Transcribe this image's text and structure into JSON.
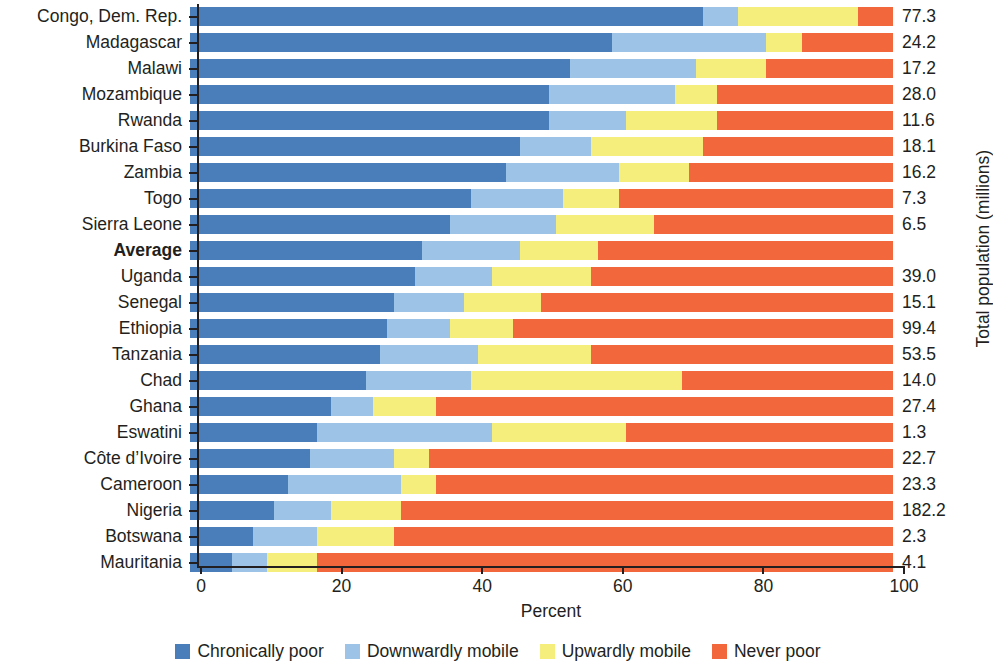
{
  "chart_data": {
    "type": "bar",
    "orientation": "horizontal",
    "stacked": true,
    "stacked_unit": "percent",
    "title": "",
    "xlabel": "Percent",
    "ylabel": "",
    "right_axis_label": "Total population (millions)",
    "xlim": [
      0,
      100
    ],
    "xticks": [
      0,
      20,
      40,
      60,
      80,
      100
    ],
    "xtick_labels": [
      "0",
      "20",
      "40",
      "60",
      "80",
      "100"
    ],
    "grid": false,
    "legend_position": "bottom",
    "series": [
      {
        "name": "Chronically poor",
        "color": "#4a7ebb",
        "key": "chronically_poor"
      },
      {
        "name": "Downwardly mobile",
        "color": "#9dc3e6",
        "key": "downwardly_mobile"
      },
      {
        "name": "Upwardly mobile",
        "color": "#f5ee7d",
        "key": "upwardly_mobile"
      },
      {
        "name": "Never poor",
        "color": "#f2683c",
        "key": "never_poor"
      }
    ],
    "categories": [
      "Congo, Dem. Rep.",
      "Madagascar",
      "Malawi",
      "Mozambique",
      "Rwanda",
      "Burkina Faso",
      "Zambia",
      "Togo",
      "Sierra Leone",
      "Average",
      "Uganda",
      "Senegal",
      "Ethiopia",
      "Tanzania",
      "Chad",
      "Ghana",
      "Eswatini",
      "Côte d’Ivoire",
      "Cameroon",
      "Nigeria",
      "Botswana",
      "Mauritania"
    ],
    "rows": [
      {
        "category": "Congo, Dem. Rep.",
        "chronically_poor": 73.0,
        "downwardly_mobile": 5.0,
        "upwardly_mobile": 17.0,
        "never_poor": 5.0,
        "total_population": "77.3",
        "bold": false
      },
      {
        "category": "Madagascar",
        "chronically_poor": 60.0,
        "downwardly_mobile": 22.0,
        "upwardly_mobile": 5.0,
        "never_poor": 13.0,
        "total_population": "24.2",
        "bold": false
      },
      {
        "category": "Malawi",
        "chronically_poor": 54.0,
        "downwardly_mobile": 18.0,
        "upwardly_mobile": 10.0,
        "never_poor": 18.0,
        "total_population": "17.2",
        "bold": false
      },
      {
        "category": "Mozambique",
        "chronically_poor": 51.0,
        "downwardly_mobile": 18.0,
        "upwardly_mobile": 6.0,
        "never_poor": 25.0,
        "total_population": "28.0",
        "bold": false
      },
      {
        "category": "Rwanda",
        "chronically_poor": 51.0,
        "downwardly_mobile": 11.0,
        "upwardly_mobile": 13.0,
        "never_poor": 25.0,
        "total_population": "11.6",
        "bold": false
      },
      {
        "category": "Burkina Faso",
        "chronically_poor": 47.0,
        "downwardly_mobile": 10.0,
        "upwardly_mobile": 16.0,
        "never_poor": 27.0,
        "total_population": "18.1",
        "bold": false
      },
      {
        "category": "Zambia",
        "chronically_poor": 45.0,
        "downwardly_mobile": 16.0,
        "upwardly_mobile": 10.0,
        "never_poor": 29.0,
        "total_population": "16.2",
        "bold": false
      },
      {
        "category": "Togo",
        "chronically_poor": 40.0,
        "downwardly_mobile": 13.0,
        "upwardly_mobile": 8.0,
        "never_poor": 39.0,
        "total_population": "7.3",
        "bold": false
      },
      {
        "category": "Sierra Leone",
        "chronically_poor": 37.0,
        "downwardly_mobile": 15.0,
        "upwardly_mobile": 14.0,
        "never_poor": 34.0,
        "total_population": "6.5",
        "bold": false
      },
      {
        "category": "Average",
        "chronically_poor": 33.0,
        "downwardly_mobile": 14.0,
        "upwardly_mobile": 11.0,
        "never_poor": 42.0,
        "total_population": "",
        "bold": true
      },
      {
        "category": "Uganda",
        "chronically_poor": 32.0,
        "downwardly_mobile": 11.0,
        "upwardly_mobile": 14.0,
        "never_poor": 43.0,
        "total_population": "39.0",
        "bold": false
      },
      {
        "category": "Senegal",
        "chronically_poor": 29.0,
        "downwardly_mobile": 10.0,
        "upwardly_mobile": 11.0,
        "never_poor": 50.0,
        "total_population": "15.1",
        "bold": false
      },
      {
        "category": "Ethiopia",
        "chronically_poor": 28.0,
        "downwardly_mobile": 9.0,
        "upwardly_mobile": 9.0,
        "never_poor": 54.0,
        "total_population": "99.4",
        "bold": false
      },
      {
        "category": "Tanzania",
        "chronically_poor": 27.0,
        "downwardly_mobile": 14.0,
        "upwardly_mobile": 16.0,
        "never_poor": 43.0,
        "total_population": "53.5",
        "bold": false
      },
      {
        "category": "Chad",
        "chronically_poor": 25.0,
        "downwardly_mobile": 15.0,
        "upwardly_mobile": 30.0,
        "never_poor": 30.0,
        "total_population": "14.0",
        "bold": false
      },
      {
        "category": "Ghana",
        "chronically_poor": 20.0,
        "downwardly_mobile": 6.0,
        "upwardly_mobile": 9.0,
        "never_poor": 65.0,
        "total_population": "27.4",
        "bold": false
      },
      {
        "category": "Eswatini",
        "chronically_poor": 18.0,
        "downwardly_mobile": 25.0,
        "upwardly_mobile": 19.0,
        "never_poor": 38.0,
        "total_population": "1.3",
        "bold": false
      },
      {
        "category": "Côte d’Ivoire",
        "chronically_poor": 17.0,
        "downwardly_mobile": 12.0,
        "upwardly_mobile": 5.0,
        "never_poor": 66.0,
        "total_population": "22.7",
        "bold": false
      },
      {
        "category": "Cameroon",
        "chronically_poor": 14.0,
        "downwardly_mobile": 16.0,
        "upwardly_mobile": 5.0,
        "never_poor": 65.0,
        "total_population": "23.3",
        "bold": false
      },
      {
        "category": "Nigeria",
        "chronically_poor": 12.0,
        "downwardly_mobile": 8.0,
        "upwardly_mobile": 10.0,
        "never_poor": 70.0,
        "total_population": "182.2",
        "bold": false
      },
      {
        "category": "Botswana",
        "chronically_poor": 9.0,
        "downwardly_mobile": 9.0,
        "upwardly_mobile": 11.0,
        "never_poor": 71.0,
        "total_population": "2.3",
        "bold": false
      },
      {
        "category": "Mauritania",
        "chronically_poor": 6.0,
        "downwardly_mobile": 5.0,
        "upwardly_mobile": 7.0,
        "never_poor": 82.0,
        "total_population": "4.1",
        "bold": false
      }
    ]
  }
}
